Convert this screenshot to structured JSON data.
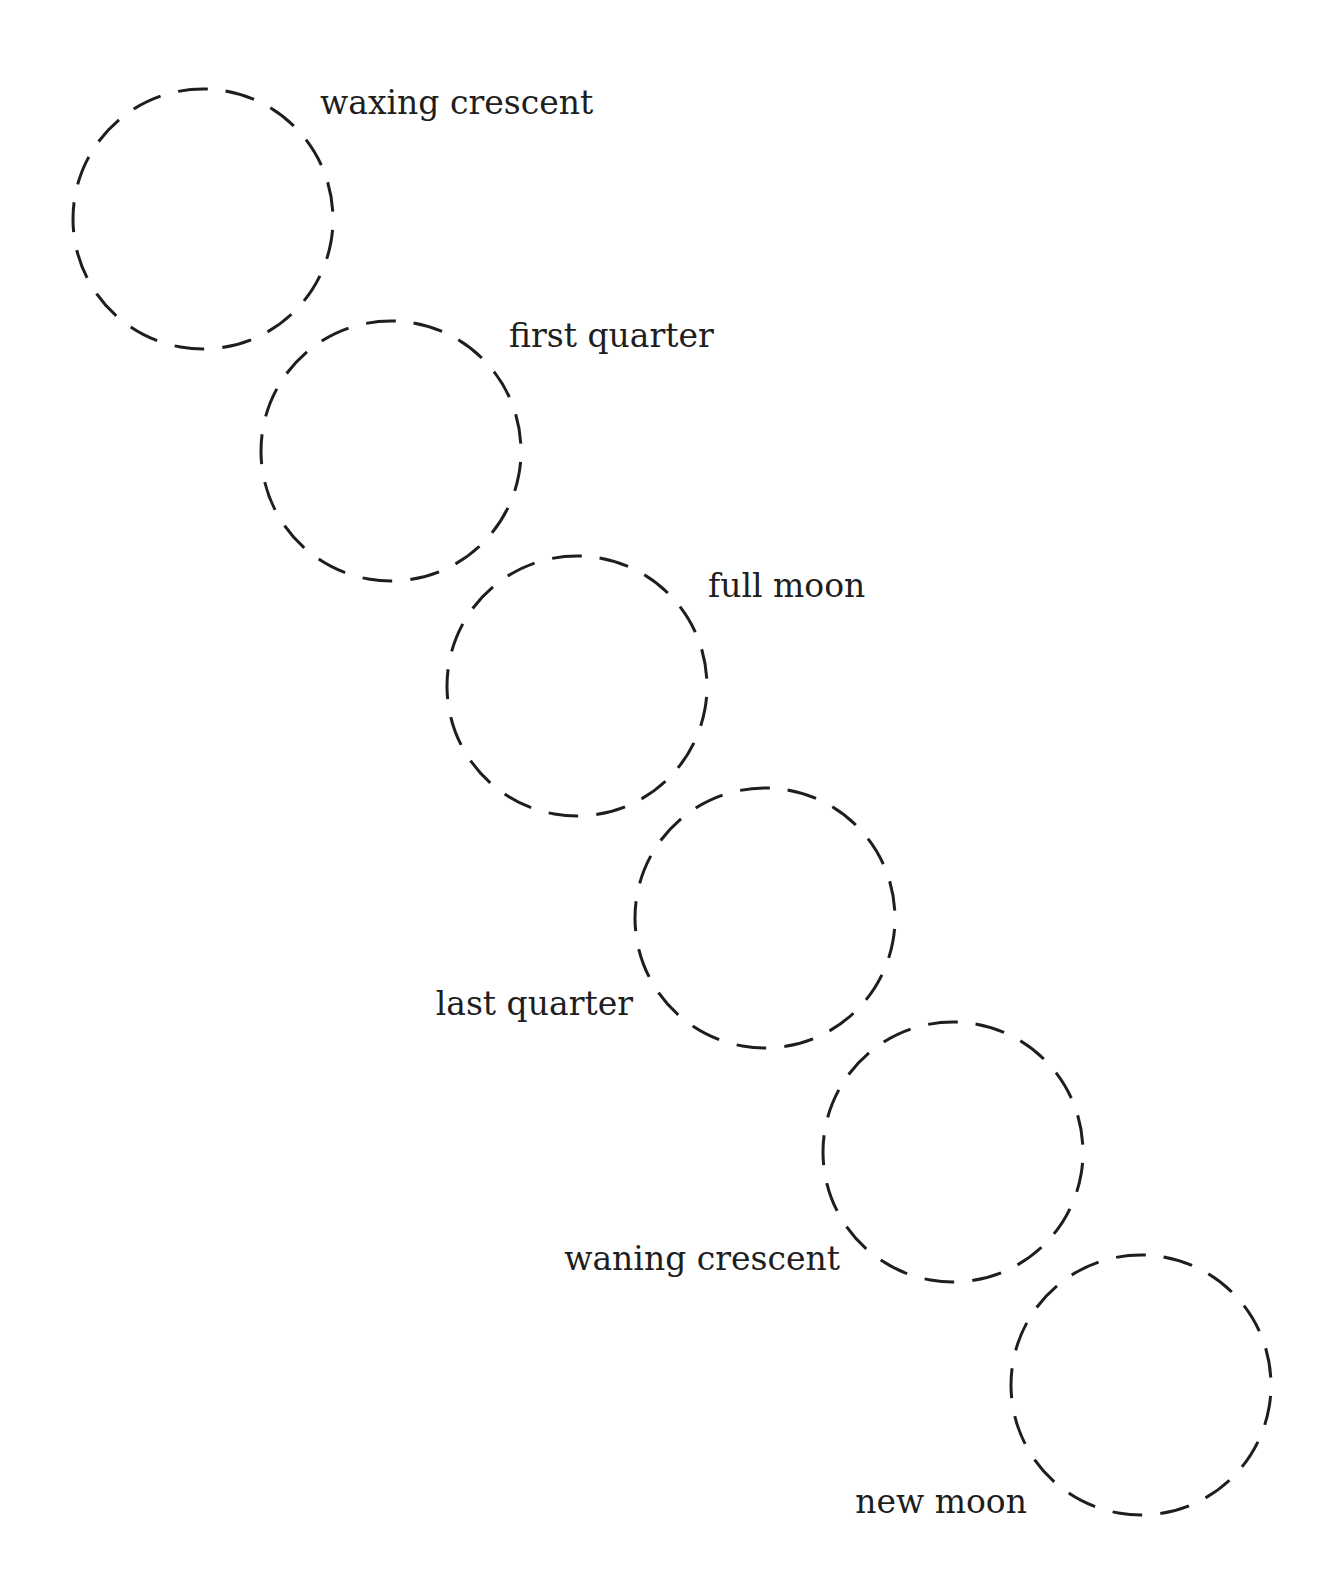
{
  "diagram": {
    "type": "moon-phase-sequence",
    "stroke_color": "#1e1e1e",
    "background": "#ffffff",
    "ring_style": "dashed",
    "phases": [
      {
        "label": "waxing crescent",
        "cx": 203,
        "cy": 219,
        "r": 130,
        "label_x": 320,
        "label_y": 114,
        "anchor": "start"
      },
      {
        "label": "first quarter",
        "cx": 391,
        "cy": 451,
        "r": 130,
        "label_x": 509,
        "label_y": 347,
        "anchor": "start"
      },
      {
        "label": "full moon",
        "cx": 577,
        "cy": 686,
        "r": 130,
        "label_x": 708,
        "label_y": 597,
        "anchor": "start"
      },
      {
        "label": "last quarter",
        "cx": 765,
        "cy": 918,
        "r": 130,
        "label_x": 633,
        "label_y": 1015,
        "anchor": "end"
      },
      {
        "label": "waning crescent",
        "cx": 953,
        "cy": 1152,
        "r": 130,
        "label_x": 840,
        "label_y": 1270,
        "anchor": "end"
      },
      {
        "label": "new moon",
        "cx": 1141,
        "cy": 1385,
        "r": 130,
        "label_x": 1027,
        "label_y": 1513,
        "anchor": "end"
      }
    ]
  }
}
